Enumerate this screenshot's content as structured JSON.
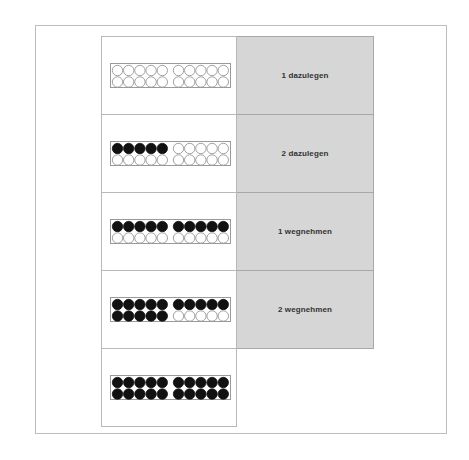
{
  "rows": [
    {
      "filled_top": 0,
      "filled_bottom": 0,
      "instruction": "1 dazulegen"
    },
    {
      "filled_top": 5,
      "filled_bottom": 0,
      "instruction": "2 dazulegen"
    },
    {
      "filled_top": 10,
      "filled_bottom": 0,
      "instruction": "1 wegnehmen"
    },
    {
      "filled_top": 10,
      "filled_bottom": 5,
      "instruction": "2 wegnehmen"
    },
    {
      "filled_top": 10,
      "filled_bottom": 10,
      "instruction": null
    }
  ],
  "rack": {
    "beads_per_row": 10,
    "group_size": 5
  },
  "colors": {
    "filled": "#111111",
    "empty_stroke": "#8a8a8a",
    "instruction_bg": "#d6d6d6"
  }
}
